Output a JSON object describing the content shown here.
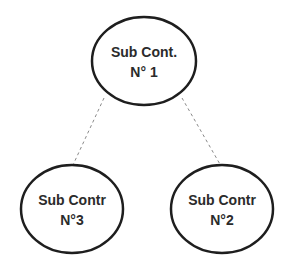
{
  "diagram": {
    "type": "tree",
    "colors": {
      "stroke": "#1e1e1e",
      "connector": "#8a8a8a",
      "text": "#2b2b2b",
      "background": "#ffffff"
    },
    "nodes": [
      {
        "id": "n1",
        "line1": "Sub Cont.",
        "line2": "N° 1"
      },
      {
        "id": "n3",
        "line1": "Sub Contr",
        "line2": "N°3"
      },
      {
        "id": "n2",
        "line1": "Sub Contr",
        "line2": "N°2"
      }
    ],
    "edges": [
      {
        "from": "n1",
        "to": "n3",
        "style": "dashed"
      },
      {
        "from": "n1",
        "to": "n2",
        "style": "dashed"
      }
    ]
  }
}
